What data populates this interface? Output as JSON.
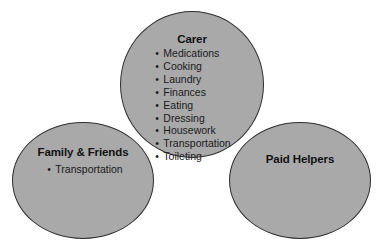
{
  "diagram": {
    "background_color": "#ffffff",
    "bubble_fill_color": "#a9a9a9",
    "bubble_stroke_color": "#2e2e2e",
    "text_color": "#000000",
    "bullet_glyph": "•",
    "groups": [
      {
        "id": "carer",
        "heading": "Carer",
        "items": [
          "Medications",
          "Cooking",
          "Laundry",
          "Finances",
          "Eating",
          "Dressing",
          "Housework",
          "Transportation",
          "Toileting"
        ]
      },
      {
        "id": "family",
        "heading": "Family & Friends",
        "items": [
          "Transportation"
        ]
      },
      {
        "id": "paid",
        "heading": "Paid Helpers",
        "items": []
      }
    ]
  }
}
